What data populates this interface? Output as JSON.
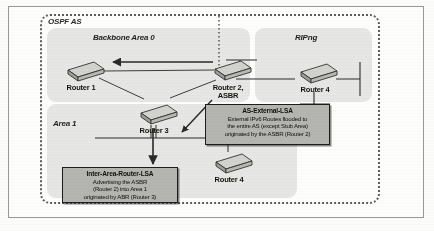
{
  "figure": {
    "type": "network-diagram",
    "title_visible": false
  },
  "as_boundary": {
    "label": "OSPF AS",
    "style": "dotted",
    "color": "#5d5d58"
  },
  "zones": [
    {
      "id": "backbone",
      "label": "Backbone Area 0",
      "fill": "#e6e6e4"
    },
    {
      "id": "ripng",
      "label": "RIPng",
      "fill": "#e6e6e4"
    },
    {
      "id": "area1",
      "label": "Area 1",
      "fill": "#e6e6e4"
    }
  ],
  "routers": [
    {
      "id": "router1",
      "label": "Router 1",
      "zone": "backbone"
    },
    {
      "id": "router2",
      "label": "Router 2,\nASBR",
      "label_line1": "Router 2,",
      "label_line2": "ASBR",
      "zone": "backbone"
    },
    {
      "id": "router4_ripng",
      "label": "Router 4",
      "zone": "ripng"
    },
    {
      "id": "router3",
      "label": "Router 3",
      "zone": "area1-boundary"
    },
    {
      "id": "router4_area1",
      "label": "Router 4",
      "zone": "area1"
    }
  ],
  "callouts": [
    {
      "id": "as-external-lsa",
      "title": "AS-External-LSA",
      "lines": [
        "External IPv6 Routes flooded to",
        "the entire AS (except Stub Area)",
        "originated by the ASBR (Router 2)"
      ],
      "fill": "#b4b4b0"
    },
    {
      "id": "inter-area-router-lsa",
      "title": "Inter-Area-Router-LSA",
      "lines": [
        "Advertising the ASBR",
        "(Router 2) into Area 1",
        "originated by ABR (Router 3)"
      ],
      "fill": "#b4b4b0"
    }
  ],
  "colors": {
    "zone_fill": "#e6e6e4",
    "callout_fill": "#b4b4b0",
    "line": "#2a2a27",
    "page": "#fdfdfc",
    "frame": "#9a9a94"
  }
}
